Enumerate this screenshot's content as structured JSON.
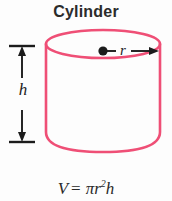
{
  "figure": {
    "title": "Cylinder",
    "background_color": "#fdfdfd",
    "shape_color": "#ef4f76",
    "annotation_color": "#1c1c1c",
    "shape_name": "cylinder"
  },
  "labels": {
    "height": "h",
    "radius": "r"
  },
  "formula": {
    "lhs": "V",
    "equals": "=",
    "pi": "π",
    "radius_var": "r",
    "exponent": "2",
    "height_var": "h",
    "full_text": "V = πr²h"
  },
  "geometry": {
    "top_ellipse_cx": 103,
    "top_ellipse_cy": 44,
    "top_ellipse_rx": 57,
    "top_ellipse_ry": 14,
    "body_top_y": 44,
    "body_bottom_y": 152,
    "left_x": 46,
    "right_x": 160,
    "height_arrow_x": 22,
    "height_arrow_top_y": 46,
    "height_arrow_bottom_y": 142,
    "radius_dot_cx": 103,
    "radius_dot_cy": 51,
    "radius_dot_r": 4.5
  }
}
